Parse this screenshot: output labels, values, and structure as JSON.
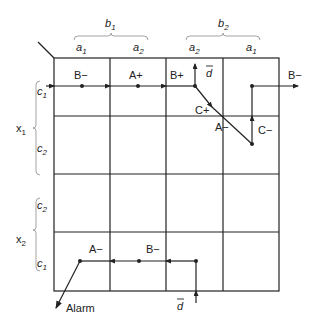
{
  "diagram": {
    "type": "karnaugh-map-state-transition",
    "column_groups": [
      {
        "label": "b",
        "sub": "1",
        "columns": [
          {
            "label": "a",
            "sub": "1"
          },
          {
            "label": "a",
            "sub": "2"
          }
        ]
      },
      {
        "label": "b",
        "sub": "2",
        "columns": [
          {
            "label": "a",
            "sub": "2"
          },
          {
            "label": "a",
            "sub": "1"
          }
        ]
      }
    ],
    "row_groups": [
      {
        "label": "x",
        "sub": "1",
        "rows": [
          {
            "label": "c",
            "sub": "1"
          },
          {
            "label": "c",
            "sub": "2"
          }
        ]
      },
      {
        "label": "x",
        "sub": "2",
        "rows": [
          {
            "label": "c",
            "sub": "2"
          },
          {
            "label": "c",
            "sub": "1"
          }
        ]
      }
    ],
    "transition_labels": {
      "b_minus_1": "B−",
      "a_plus": "A+",
      "b_plus": "B+",
      "d_bar_top": "d",
      "c_plus": "C+",
      "a_minus_1": "A−",
      "c_minus": "C−",
      "b_minus_out": "B−",
      "a_minus_2": "A−",
      "b_minus_2": "B−",
      "d_bar_bottom": "d",
      "alarm": "Alarm"
    },
    "colors": {
      "line": "#222222",
      "background": "#ffffff"
    }
  }
}
